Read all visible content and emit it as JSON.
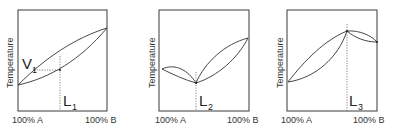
{
  "diagrams": [
    {
      "id": "diagram-1",
      "y_axis_label": "Temperature",
      "x_left_label": "100% A",
      "x_right_label": "100% B",
      "vapor_label": "V",
      "vapor_sub": "1",
      "liquid_label": "L",
      "liquid_sub": "1",
      "type": "ideal lens (no azeotrope)"
    },
    {
      "id": "diagram-2",
      "y_axis_label": "Temperature",
      "x_left_label": "100% A",
      "x_right_label": "100% B",
      "liquid_label": "L",
      "liquid_sub": "2",
      "type": "minimum-boiling azeotrope"
    },
    {
      "id": "diagram-3",
      "y_axis_label": "Temperature",
      "x_left_label": "100% A",
      "x_right_label": "100% B",
      "liquid_label": "L",
      "liquid_sub": "3",
      "type": "maximum-boiling azeotrope"
    }
  ]
}
